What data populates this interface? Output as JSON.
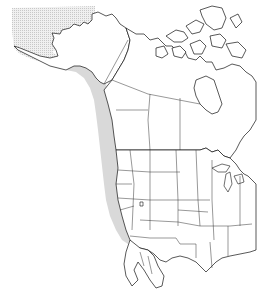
{
  "map": {
    "region": "North America",
    "projection": "conic outline with political boundaries",
    "colors": {
      "background": "#ffffff",
      "outline": "#111111",
      "range_fill": "#d9d9d9",
      "stippled_area": "#e4e4e4"
    },
    "layers": [
      {
        "id": "range",
        "label": "Pacific coastal range (shaded)",
        "description": "Narrow shaded band from Gulf of Alaska down the Pacific coast to southern California / northern Baja"
      },
      {
        "id": "stippled",
        "label": "Bering Sea / western Alaska stippled area",
        "description": "Dotted fill over Bering Sea and western Alaska"
      },
      {
        "id": "boundaries",
        "label": "Canadian provinces and US states boundaries"
      }
    ],
    "labels": []
  }
}
